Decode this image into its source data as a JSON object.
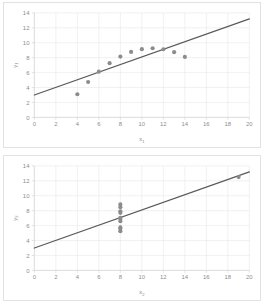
{
  "figure": {
    "title": "",
    "panel_count": 2,
    "marker_color": "#8c8c8c",
    "line_color": "#595959",
    "grid_color": "#e8e8e8",
    "border_color": "#e2e2e2",
    "background": "#ffffff"
  },
  "chart_data": [
    {
      "id": "chart-top",
      "type": "scatter",
      "title": "",
      "xlabel": "x",
      "xlabel_sub": "1",
      "ylabel": "y",
      "ylabel_sub": "1",
      "xlim": [
        0,
        20
      ],
      "ylim": [
        0,
        14
      ],
      "xticks": [
        0,
        2,
        4,
        6,
        8,
        10,
        12,
        14,
        16,
        18,
        20
      ],
      "yticks": [
        0,
        2,
        4,
        6,
        8,
        10,
        12,
        14
      ],
      "grid": true,
      "legend": "none",
      "x": [
        4,
        5,
        6,
        7,
        8,
        9,
        10,
        11,
        12,
        13,
        14
      ],
      "y": [
        3.1,
        4.74,
        6.13,
        7.26,
        8.14,
        8.77,
        9.14,
        9.26,
        9.13,
        8.74,
        8.1
      ],
      "trendline": {
        "type": "linear",
        "x": [
          0,
          20
        ],
        "y": [
          3.0,
          13.2
        ]
      }
    },
    {
      "id": "chart-bottom",
      "type": "scatter",
      "title": "",
      "xlabel": "x",
      "xlabel_sub": "2",
      "ylabel": "y",
      "ylabel_sub": "2",
      "xlim": [
        0,
        20
      ],
      "ylim": [
        0,
        14
      ],
      "xticks": [
        0,
        2,
        4,
        6,
        8,
        10,
        12,
        14,
        16,
        18,
        20
      ],
      "yticks": [
        0,
        2,
        4,
        6,
        8,
        10,
        12,
        14
      ],
      "grid": true,
      "legend": "none",
      "x": [
        8,
        8,
        8,
        8,
        8,
        8,
        8,
        8,
        8,
        8,
        19
      ],
      "y": [
        6.58,
        5.76,
        7.71,
        8.84,
        8.47,
        7.04,
        5.25,
        5.56,
        7.91,
        6.89,
        12.5
      ],
      "trendline": {
        "type": "linear",
        "x": [
          0,
          20
        ],
        "y": [
          3.0,
          13.2
        ]
      }
    }
  ]
}
